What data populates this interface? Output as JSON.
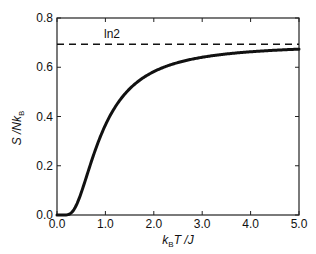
{
  "chart_data": {
    "type": "line",
    "title": "",
    "xlabel": "k_B T / J",
    "ylabel": "S / N k_B",
    "xlim": [
      0.0,
      5.0
    ],
    "ylim": [
      0.0,
      0.8
    ],
    "grid": false,
    "legend": null,
    "x_ticks": [
      "0.0",
      "1.0",
      "2.0",
      "3.0",
      "4.0",
      "5.0"
    ],
    "y_ticks": [
      "0.0",
      "0.2",
      "0.4",
      "0.6",
      "0.8"
    ],
    "series": [
      {
        "name": "S/NkB",
        "style": "solid-thick",
        "color": "#111111",
        "x": [
          0.0,
          0.1,
          0.2,
          0.3,
          0.4,
          0.5,
          0.6,
          0.7,
          0.8,
          0.9,
          1.0,
          1.2,
          1.4,
          1.6,
          1.8,
          2.0,
          2.5,
          3.0,
          3.5,
          4.0,
          4.5,
          5.0
        ],
        "y": [
          0.0,
          0.0,
          0.0,
          0.009,
          0.04,
          0.091,
          0.151,
          0.21,
          0.265,
          0.316,
          0.365,
          0.434,
          0.487,
          0.527,
          0.558,
          0.583,
          0.626,
          0.65,
          0.665,
          0.676,
          0.684,
          0.674
        ]
      },
      {
        "name": "ln2",
        "style": "dashed",
        "color": "#111111",
        "x": [
          0.0,
          5.0
        ],
        "y": [
          0.693,
          0.693
        ]
      }
    ],
    "annotations": [
      {
        "text": "ln2",
        "x": 0.75,
        "y": 0.72
      }
    ]
  },
  "labels": {
    "ylabel_main": "S /Nk",
    "ylabel_sub": "B",
    "xlabel_k": "k",
    "xlabel_sub": "B",
    "xlabel_rest": "T /J",
    "annotation": "ln2"
  }
}
